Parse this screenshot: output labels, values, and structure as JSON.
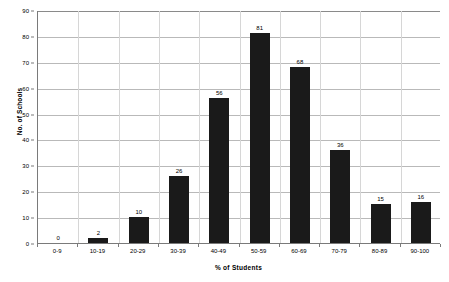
{
  "chart_data": {
    "type": "bar",
    "title": "",
    "xlabel": "% of Students",
    "ylabel": "No. of Schools",
    "categories": [
      "0-9",
      "10-19",
      "20-29",
      "30-39",
      "40-49",
      "50-59",
      "60-69",
      "70-79",
      "80-89",
      "90-100"
    ],
    "values": [
      0,
      2,
      10,
      26,
      56,
      81,
      68,
      36,
      15,
      16
    ],
    "value_labels": [
      "0",
      "2",
      "10",
      "26",
      "56",
      "81",
      "68",
      "36",
      "15",
      "16"
    ],
    "ylim": [
      0,
      90
    ],
    "ytick_values": [
      0,
      10,
      20,
      30,
      40,
      50,
      60,
      70,
      80,
      90
    ],
    "ytick_labels": [
      "0",
      "10",
      "20",
      "30",
      "40",
      "50",
      "60",
      "70",
      "80",
      "90"
    ],
    "grid": true,
    "grid_axis": "y",
    "legend": false,
    "legend_position": "none",
    "bar_color": "#1a1a1a",
    "grid_color": "#b9b9b9",
    "axis_color": "#7a7a7a",
    "background_color": "#ffffff",
    "show_value_labels": true
  }
}
